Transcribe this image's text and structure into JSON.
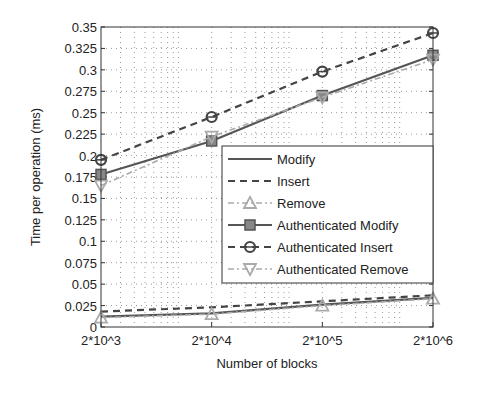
{
  "chart_data": {
    "type": "line",
    "title": "",
    "xlabel": "Number of blocks",
    "ylabel": "Time per operation (ms)",
    "x": [
      "2*10^3",
      "2*10^4",
      "2*10^5",
      "2*10^6"
    ],
    "x_scale": "log",
    "ylim": [
      0,
      0.35
    ],
    "yticks": [
      "0",
      "0.025",
      "0.05",
      "0.075",
      "0.1",
      "0.125",
      "0.15",
      "0.175",
      "0.2",
      "0.225",
      "0.25",
      "0.275",
      "0.3",
      "0.325",
      "0.35"
    ],
    "grid": true,
    "legend_position": "center-right",
    "series": [
      {
        "name": "Modify",
        "values": [
          0.012,
          0.016,
          0.026,
          0.034
        ],
        "style": "solid",
        "marker": "none",
        "color": "#555555"
      },
      {
        "name": "Insert",
        "values": [
          0.018,
          0.023,
          0.03,
          0.037
        ],
        "style": "dashed",
        "marker": "none",
        "color": "#444444"
      },
      {
        "name": "Remove",
        "values": [
          0.011,
          0.015,
          0.025,
          0.033
        ],
        "style": "dashdot",
        "marker": "triangle-up",
        "color": "#aaaaaa"
      },
      {
        "name": "Authenticated Modify",
        "values": [
          0.178,
          0.217,
          0.27,
          0.317
        ],
        "style": "solid",
        "marker": "square",
        "color": "#555555"
      },
      {
        "name": "Authenticated Insert",
        "values": [
          0.195,
          0.245,
          0.298,
          0.343
        ],
        "style": "dashed",
        "marker": "circle",
        "color": "#444444"
      },
      {
        "name": "Authenticated Remove",
        "values": [
          0.165,
          0.222,
          0.268,
          0.312
        ],
        "style": "dashdot",
        "marker": "triangle-down",
        "color": "#aaaaaa"
      }
    ]
  }
}
